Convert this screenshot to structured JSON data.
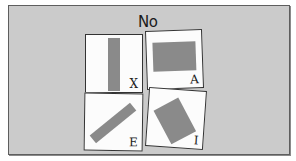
{
  "prompt": {
    "label": "No"
  },
  "colors": {
    "background": "#cbcbcb",
    "card": "#fcfcfc",
    "shape": "#8a8a8a",
    "border": "#333333"
  },
  "cards": [
    {
      "letter": "X",
      "shape": "vertical-bar"
    },
    {
      "letter": "A",
      "shape": "horizontal-rectangle"
    },
    {
      "letter": "E",
      "shape": "diagonal-bar"
    },
    {
      "letter": "I",
      "shape": "tilted-rectangle"
    }
  ]
}
